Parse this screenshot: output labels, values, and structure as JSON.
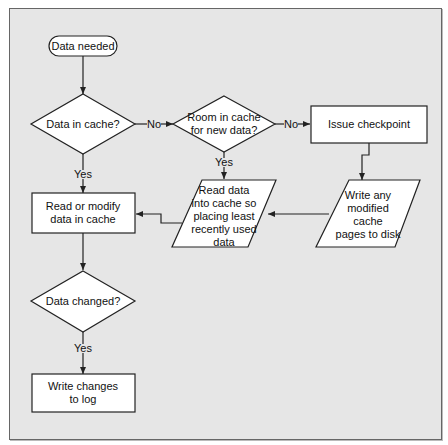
{
  "diagram": {
    "type": "flowchart",
    "colors": {
      "background": "#e6e6e6",
      "shape_fill": "#ffffff",
      "stroke": "#222222"
    },
    "nodes": {
      "start": {
        "shape": "terminator",
        "lines": [
          "Data needed"
        ]
      },
      "in_cache": {
        "shape": "decision",
        "lines": [
          "Data in cache?"
        ]
      },
      "room": {
        "shape": "decision",
        "lines": [
          "Room in cache",
          "for new data?"
        ]
      },
      "checkpoint": {
        "shape": "process",
        "lines": [
          "Issue checkpoint"
        ]
      },
      "write_pages": {
        "shape": "io",
        "lines": [
          "Write any",
          "modified",
          "cache",
          "pages to disk"
        ]
      },
      "read_into": {
        "shape": "io",
        "lines": [
          "Read data",
          "into cache so",
          "placing least",
          "recently used",
          "data"
        ]
      },
      "read_modify": {
        "shape": "process",
        "lines": [
          "Read or modify",
          "data in cache"
        ]
      },
      "changed": {
        "shape": "decision",
        "lines": [
          "Data changed?"
        ]
      },
      "write_log": {
        "shape": "process",
        "lines": [
          "Write changes",
          "to log"
        ]
      }
    },
    "edge_labels": {
      "no1": "No",
      "no2": "No",
      "yes1": "Yes",
      "yes2": "Yes",
      "yes3": "Yes"
    },
    "edges": [
      [
        "start",
        "in_cache",
        ""
      ],
      [
        "in_cache",
        "room",
        "No"
      ],
      [
        "in_cache",
        "read_modify",
        "Yes"
      ],
      [
        "room",
        "checkpoint",
        "No"
      ],
      [
        "room",
        "read_into",
        "Yes"
      ],
      [
        "checkpoint",
        "write_pages",
        ""
      ],
      [
        "write_pages",
        "read_into",
        ""
      ],
      [
        "read_into",
        "read_modify",
        ""
      ],
      [
        "read_modify",
        "changed",
        ""
      ],
      [
        "changed",
        "write_log",
        "Yes"
      ]
    ]
  }
}
